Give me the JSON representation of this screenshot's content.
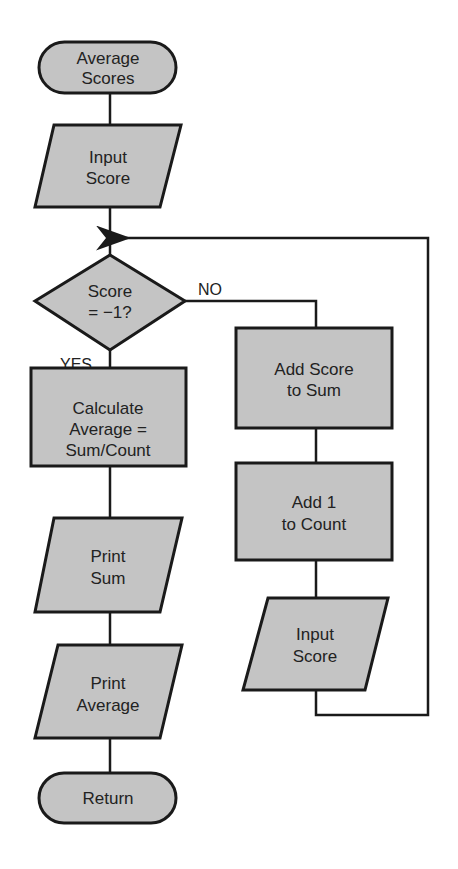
{
  "diagram": {
    "type": "flowchart",
    "colors": {
      "shape_fill": "#c4c4c4",
      "stroke": "#1a1a1a",
      "background": "#ffffff"
    },
    "nodes": {
      "start": {
        "shape": "terminal",
        "lines": [
          "Average",
          "Scores"
        ]
      },
      "input1": {
        "shape": "parallelogram",
        "lines": [
          "Input",
          "Score"
        ]
      },
      "decision": {
        "shape": "diamond",
        "lines": [
          "Score",
          "= −1?"
        ]
      },
      "calc": {
        "shape": "rectangle",
        "lines": [
          "Calculate",
          "Average =",
          "Sum/Count"
        ]
      },
      "printSum": {
        "shape": "parallelogram",
        "lines": [
          "Print",
          "Sum"
        ]
      },
      "printAvg": {
        "shape": "parallelogram",
        "lines": [
          "Print",
          "Average"
        ]
      },
      "ret": {
        "shape": "terminal",
        "lines": [
          "Return"
        ]
      },
      "addSum": {
        "shape": "rectangle",
        "lines": [
          "Add Score",
          "to Sum"
        ]
      },
      "addCount": {
        "shape": "rectangle",
        "lines": [
          "Add 1",
          "to Count"
        ]
      },
      "input2": {
        "shape": "parallelogram",
        "lines": [
          "Input",
          "Score"
        ]
      }
    },
    "edge_labels": {
      "no": "NO",
      "yes": "YES"
    },
    "edges": [
      [
        "start",
        "input1"
      ],
      [
        "input1",
        "decision"
      ],
      [
        "decision",
        "calc",
        "YES"
      ],
      [
        "calc",
        "printSum"
      ],
      [
        "printSum",
        "printAvg"
      ],
      [
        "printAvg",
        "ret"
      ],
      [
        "decision",
        "addSum",
        "NO"
      ],
      [
        "addSum",
        "addCount"
      ],
      [
        "addCount",
        "input2"
      ],
      [
        "input2",
        "decision"
      ]
    ]
  }
}
